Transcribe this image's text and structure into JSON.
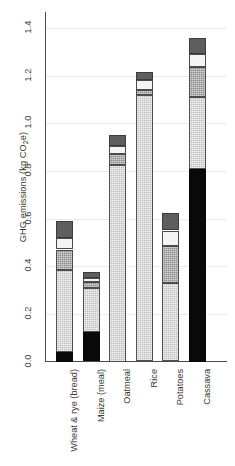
{
  "chart_data": {
    "type": "bar",
    "subtype": "stacked-bar",
    "title": "",
    "xlabel": "",
    "ylabel": "GHG emissions (kg CO2e)",
    "ylabel_parts": {
      "prefix": "GHG emissions (kg CO",
      "sub": "2",
      "suffix": "e)"
    },
    "ylim": [
      0.0,
      1.4
    ],
    "ytick_labels": [
      "0.0",
      "0.2",
      "0.4",
      "0.6",
      "0.8",
      "1.0",
      "1.2",
      "1.4"
    ],
    "ytick_values": [
      0.0,
      0.2,
      0.4,
      0.6,
      0.8,
      1.0,
      1.2,
      1.4
    ],
    "grid": true,
    "grid_axis": "y",
    "legend": "none",
    "categories": [
      "Wheat & rye (bread)",
      "Maize (meal)",
      "Oatmeal",
      "Rice",
      "Potatoes",
      "Cassava"
    ],
    "series": [
      {
        "name": "segment-1",
        "pattern": "solid-black",
        "color": "#090909",
        "values": [
          0.04,
          0.125,
          0.0,
          0.0,
          0.0,
          0.81
        ]
      },
      {
        "name": "segment-2",
        "pattern": "light-hatch",
        "color": "#bdbdbd",
        "values": [
          0.345,
          0.185,
          0.825,
          1.12,
          0.33,
          0.3
        ]
      },
      {
        "name": "segment-3",
        "pattern": "mid-gray-hatch",
        "color": "#8a8a8a",
        "values": [
          0.085,
          0.025,
          0.045,
          0.02,
          0.155,
          0.125
        ]
      },
      {
        "name": "segment-4",
        "pattern": "white",
        "color": "#f4f4f4",
        "values": [
          0.05,
          0.015,
          0.035,
          0.04,
          0.065,
          0.055
        ]
      },
      {
        "name": "segment-5",
        "pattern": "dark-gray",
        "color": "#5e5e5e",
        "values": [
          0.07,
          0.025,
          0.045,
          0.035,
          0.075,
          0.07
        ]
      }
    ],
    "totals": [
      0.59,
      0.375,
      0.95,
      1.215,
      0.625,
      1.36
    ]
  }
}
